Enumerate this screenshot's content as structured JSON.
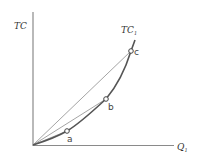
{
  "diagram": {
    "y_axis_label": "TC",
    "x_axis_label": "Q",
    "x_axis_subscript": "1",
    "curve_label": "TC",
    "curve_subscript": "1",
    "points": [
      {
        "label": "a",
        "x": 67,
        "y": 131
      },
      {
        "label": "b",
        "x": 106,
        "y": 99
      },
      {
        "label": "c",
        "x": 131,
        "y": 51
      }
    ],
    "colors": {
      "axis": "#8a8a8a",
      "curve": "#555555",
      "ray": "#9a9a9a",
      "text": "#333333"
    }
  }
}
